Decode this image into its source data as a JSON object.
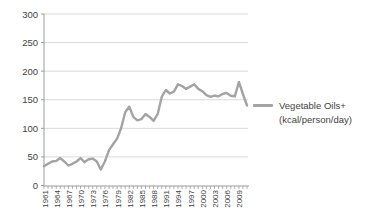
{
  "chart_data": {
    "type": "line",
    "title": "",
    "x": [
      1961,
      1962,
      1963,
      1964,
      1965,
      1966,
      1967,
      1968,
      1969,
      1970,
      1971,
      1972,
      1973,
      1974,
      1975,
      1976,
      1977,
      1978,
      1979,
      1980,
      1981,
      1982,
      1983,
      1984,
      1985,
      1986,
      1987,
      1988,
      1989,
      1990,
      1991,
      1992,
      1993,
      1994,
      1995,
      1996,
      1997,
      1998,
      1999,
      2000,
      2001,
      2002,
      2003,
      2004,
      2005,
      2006,
      2007,
      2008,
      2009,
      2010,
      2011
    ],
    "series": [
      {
        "name": "Vegetable Oils+ (kcal/person/day)",
        "values": [
          34,
          38,
          42,
          43,
          48,
          42,
          35,
          38,
          42,
          48,
          41,
          46,
          47,
          42,
          28,
          42,
          62,
          72,
          82,
          100,
          128,
          138,
          120,
          114,
          116,
          125,
          120,
          113,
          125,
          155,
          167,
          161,
          164,
          177,
          174,
          169,
          173,
          177,
          169,
          165,
          158,
          155,
          157,
          156,
          160,
          162,
          157,
          156,
          181,
          160,
          140
        ]
      }
    ],
    "xlabel": "",
    "ylabel": "",
    "ylim": [
      0,
      300
    ],
    "yticks": [
      0,
      50,
      100,
      150,
      200,
      250,
      300
    ],
    "xtick_labels": [
      "1961",
      "1964",
      "1967",
      "1970",
      "1973",
      "1976",
      "1979",
      "1982",
      "1985",
      "1988",
      "1991",
      "1994",
      "1997",
      "2000",
      "2003",
      "2006",
      "2009"
    ],
    "grid": true,
    "legend_position": "right",
    "legend": {
      "line1": "Vegetable Oils+",
      "line2": "(kcal/person/day)"
    },
    "colors": {
      "line": "#a3a3a3",
      "grid": "#d9d9d9",
      "axis": "#9b9b9b",
      "text": "#3f3f3f",
      "background": "#ffffff"
    }
  }
}
